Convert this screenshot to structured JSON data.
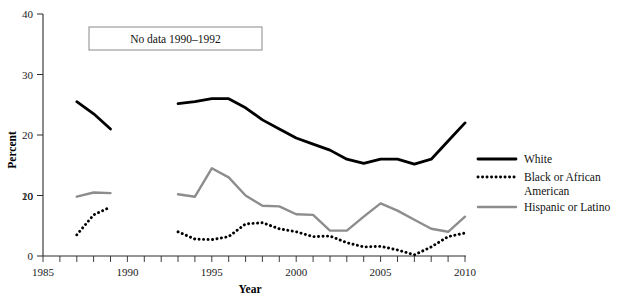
{
  "chart_data": {
    "type": "line",
    "title": "",
    "xlabel": "Year",
    "ylabel": "Percent",
    "xlim": [
      1985,
      2010
    ],
    "ylim": [
      0,
      40
    ],
    "xticks": [
      1985,
      1990,
      1995,
      2000,
      2005,
      2010
    ],
    "yticks": [
      0,
      10,
      20,
      30,
      40
    ],
    "xtick_labels": [
      "1985",
      "1990",
      "1995",
      "2000",
      "2005",
      "2010"
    ],
    "ytick_labels": [
      "0",
      "10",
      "20",
      "30",
      "40"
    ],
    "grid": false,
    "legend_position": "right",
    "annotations": [
      {
        "text": "No data 1990–1992",
        "x": 1988.6,
        "y": 35.5
      }
    ],
    "gap_years": [
      1990,
      1991,
      1992
    ],
    "series": [
      {
        "name": "White",
        "style": "solid",
        "color": "#000000",
        "segments": [
          {
            "x": [
              1987,
              1988,
              1989
            ],
            "values": [
              25.5,
              23.5,
              21.0
            ]
          },
          {
            "x": [
              1993,
              1994,
              1995,
              1996,
              1997,
              1998,
              1999,
              2000,
              2001,
              2002,
              2003,
              2004,
              2005,
              2006,
              2007,
              2008,
              2009,
              2010
            ],
            "values": [
              25.2,
              25.5,
              26.0,
              26.0,
              24.5,
              22.5,
              21.0,
              19.5,
              18.5,
              17.5,
              16.0,
              15.3,
              16.0,
              16.0,
              15.2,
              16.0,
              19.0,
              22.0
            ]
          }
        ]
      },
      {
        "name": "Black or African American",
        "style": "dotted",
        "color": "#000000",
        "segments": [
          {
            "x": [
              1987,
              1988,
              1989
            ],
            "values": [
              3.5,
              6.8,
              8.1
            ]
          },
          {
            "x": [
              1993,
              1994,
              1995,
              1996,
              1997,
              1998,
              1999,
              2000,
              2001,
              2002,
              2003,
              2004,
              2005,
              2006,
              2007,
              2008,
              2009,
              2010
            ],
            "values": [
              4.0,
              2.8,
              2.7,
              3.2,
              5.3,
              5.5,
              4.5,
              4.0,
              3.2,
              3.3,
              2.2,
              1.5,
              1.6,
              1.0,
              0.2,
              1.5,
              3.2,
              3.8
            ]
          }
        ]
      },
      {
        "name": "Hispanic or Latino",
        "style": "solid",
        "color": "#8d8d8d",
        "segments": [
          {
            "x": [
              1987,
              1988,
              1989
            ],
            "values": [
              9.8,
              10.5,
              10.4
            ]
          },
          {
            "x": [
              1993,
              1994,
              1995,
              1996,
              1997,
              1998,
              1999,
              2000,
              2001,
              2002,
              2003,
              2004,
              2005,
              2006,
              2007,
              2008,
              2009,
              2010
            ],
            "values": [
              10.2,
              9.8,
              14.5,
              13.0,
              10.0,
              8.3,
              8.2,
              6.9,
              6.8,
              4.2,
              4.2,
              6.5,
              8.7,
              7.5,
              6.0,
              4.5,
              4.0,
              6.5
            ]
          }
        ]
      }
    ]
  },
  "legend": {
    "entries": [
      {
        "label": "White",
        "style": "solid",
        "color": "#000000"
      },
      {
        "label": "Black or African",
        "label2": "American",
        "style": "dotted",
        "color": "#000000"
      },
      {
        "label": "Hispanic or Latino",
        "style": "solid",
        "color": "#8d8d8d"
      }
    ]
  },
  "axes": {
    "x_title": "Year",
    "y_title": "Percent"
  }
}
